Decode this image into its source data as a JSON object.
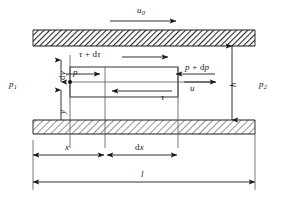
{
  "figure": {
    "type": "engineering-diagram",
    "colors": {
      "line": "#1a1a1a",
      "hatch": "#333333",
      "background": "#ffffff"
    }
  },
  "labels": {
    "u0": "u",
    "u0_sub": "0",
    "tau_plus_dtau_sym": "τ",
    "tau_plus_dtau_op": " + ",
    "tau_plus_dtau_d": "d",
    "tau_plus_dtau_tail": "τ",
    "p_left": "p",
    "p_plus_dp_sym": "p",
    "p_plus_dp_op": " + ",
    "p_plus_dp_d": "d",
    "p_plus_dp_tail": "p",
    "tau": "τ",
    "u": "u",
    "dy_d": "d",
    "dy_y": "y",
    "y": "y",
    "h": "h",
    "p1": "p",
    "p1_sub": "1",
    "p2": "p",
    "p2_sub": "2",
    "x": "x",
    "dx_d": "d",
    "dx_x": "x",
    "l": "l"
  },
  "geometry": {
    "channel_left": 33,
    "channel_right": 255,
    "top_wall_top": 30,
    "top_wall_bottom": 46,
    "bottom_wall_top": 120,
    "bottom_wall_bottom": 134,
    "cv_left": 70,
    "cv_right": 178,
    "cv_top": 67,
    "cv_bottom": 97,
    "mid_line_x": 105,
    "dim_x_y": 155,
    "dim_l_y": 182
  },
  "arrows": {
    "u0_direction": "right",
    "tau_plus_dtau_direction": "right",
    "p_direction": "right",
    "p_plus_dp_direction": "left",
    "tau_direction": "left",
    "u_direction": "right",
    "dy_direction": "vertical-double",
    "y_direction": "up",
    "h_direction": "vertical-double",
    "x_direction": "horizontal-double",
    "dx_direction": "horizontal-double",
    "l_direction": "horizontal-double"
  }
}
